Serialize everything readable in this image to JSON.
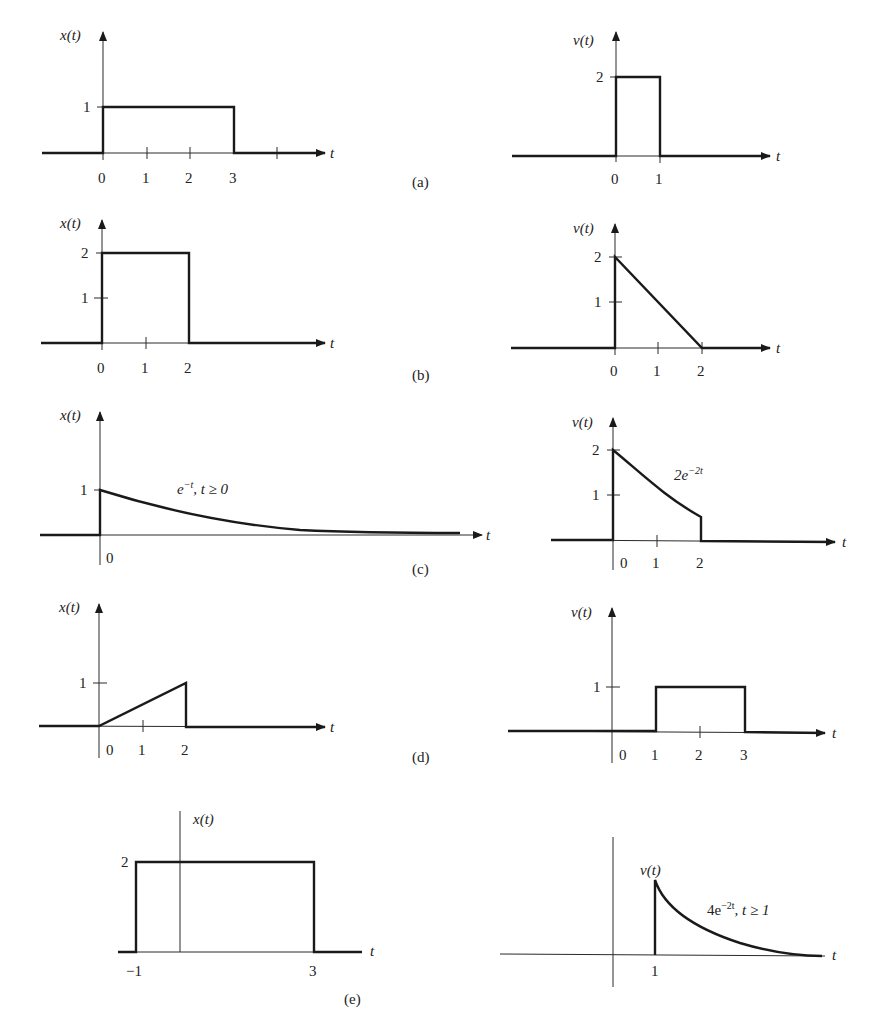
{
  "figure": {
    "panels": [
      {
        "id": "a",
        "label": "(a)"
      },
      {
        "id": "b",
        "label": "(b)"
      },
      {
        "id": "c",
        "label": "(c)"
      },
      {
        "id": "d",
        "label": "(d)"
      },
      {
        "id": "e",
        "label": "(e)"
      }
    ],
    "axis_labels": {
      "x": "x(t)",
      "v": "v(t)",
      "t": "t"
    },
    "a": {
      "x": {
        "ylabel": "x(t)",
        "yticks": [
          "1"
        ],
        "xticks": [
          "0",
          "1",
          "2",
          "3"
        ],
        "description": "rectangular pulse, height 1 from t=0 to t=3"
      },
      "v": {
        "ylabel": "v(t)",
        "yticks": [
          "2"
        ],
        "xticks": [
          "0",
          "1"
        ],
        "description": "rectangular pulse, height 2 from t=0 to t=1"
      }
    },
    "b": {
      "x": {
        "ylabel": "x(t)",
        "yticks": [
          "2",
          "1"
        ],
        "xticks": [
          "0",
          "1",
          "2"
        ],
        "description": "rectangular pulse, height 2 from t=0 to t=2"
      },
      "v": {
        "ylabel": "v(t)",
        "yticks": [
          "2",
          "1"
        ],
        "xticks": [
          "0",
          "1",
          "2"
        ],
        "description": "ramp down from 2 at t=0 to 0 at t=2"
      }
    },
    "c": {
      "x": {
        "ylabel": "x(t)",
        "yticks": [
          "1"
        ],
        "xticks": [
          "0"
        ],
        "annotation_base": "e",
        "annotation_sup": "−t",
        "annotation_rest": ", t ≥ 0",
        "description": "decaying exponential e^{-t}, t>=0"
      },
      "v": {
        "ylabel": "v(t)",
        "yticks": [
          "2",
          "1"
        ],
        "xticks": [
          "0",
          "1",
          "2"
        ],
        "annotation_base": "2e",
        "annotation_sup": "−2t",
        "description": "2e^{-2t} for 0<=t<=2, zero otherwise"
      }
    },
    "d": {
      "x": {
        "ylabel": "x(t)",
        "yticks": [
          "1"
        ],
        "xticks": [
          "0",
          "1",
          "2"
        ],
        "description": "ramp from 0 at t=0 to 1 at t=2, then drop to 0"
      },
      "v": {
        "ylabel": "v(t)",
        "yticks": [
          "1"
        ],
        "xticks": [
          "0",
          "1",
          "2",
          "3"
        ],
        "description": "rectangular pulse, height 1 from t=1 to t=3"
      }
    },
    "e": {
      "x": {
        "ylabel": "x(t)",
        "yticks": [
          "2"
        ],
        "xticks": [
          "−1",
          "3"
        ],
        "description": "rectangular pulse, height 2 from t=-1 to t=3"
      },
      "v": {
        "ylabel": "v(t)",
        "xticks": [
          "1"
        ],
        "annotation_base": "4e",
        "annotation_sup": "−2t",
        "annotation_rest": ", t ≥ 1",
        "description": "4e^{-2t} for t>=1"
      }
    }
  }
}
